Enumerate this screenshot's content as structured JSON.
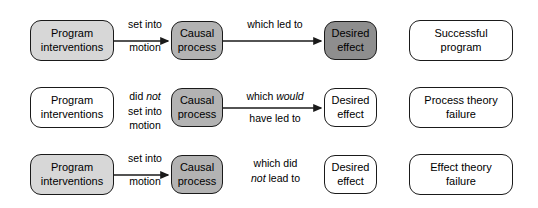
{
  "diagram": {
    "colors": {
      "stroke": "#1a1a1a",
      "fill_white": "#ffffff",
      "fill_light_gray": "#d7d7d7",
      "fill_mid_gray": "#b3b3b3",
      "fill_dark_gray": "#8e8e8e",
      "text": "#000000"
    },
    "rows": [
      {
        "id": "successful-program",
        "intervention": {
          "line1": "Program",
          "line2": "interventions",
          "fill": "light"
        },
        "connector1": {
          "line1": "set into",
          "line2": "motion",
          "italic_word": "",
          "arrow": true
        },
        "process": {
          "line1": "Causal",
          "line2": "process",
          "fill": "mid"
        },
        "connector2": {
          "line1": "which led to",
          "line2": "",
          "italic_word": "",
          "arrow": true
        },
        "effect": {
          "line1": "Desired",
          "line2": "effect",
          "fill": "dark"
        },
        "outcome": {
          "line1": "Successful",
          "line2": "program",
          "fill": "white"
        }
      },
      {
        "id": "process-theory-failure",
        "intervention": {
          "line1": "Program",
          "line2": "interventions",
          "fill": "white"
        },
        "connector1": {
          "line1": "did not",
          "line2": "set into",
          "line3": "motion",
          "italic_word": "not",
          "arrow": false
        },
        "process": {
          "line1": "Causal",
          "line2": "process",
          "fill": "mid"
        },
        "connector2": {
          "line1": "which would",
          "line2": "have led to",
          "italic_word": "would",
          "arrow": true
        },
        "effect": {
          "line1": "Desired",
          "line2": "effect",
          "fill": "white"
        },
        "outcome": {
          "line1": "Process theory",
          "line2": "failure",
          "fill": "white"
        }
      },
      {
        "id": "effect-theory-failure",
        "intervention": {
          "line1": "Program",
          "line2": "interventions",
          "fill": "light"
        },
        "connector1": {
          "line1": "set into",
          "line2": "motion",
          "italic_word": "",
          "arrow": true
        },
        "process": {
          "line1": "Causal",
          "line2": "process",
          "fill": "mid"
        },
        "connector2": {
          "line1": "which did",
          "line2": "not lead to",
          "italic_word": "not",
          "arrow": false
        },
        "effect": {
          "line1": "Desired",
          "line2": "effect",
          "fill": "white"
        },
        "outcome": {
          "line1": "Effect theory",
          "line2": "failure",
          "fill": "white"
        }
      }
    ]
  }
}
